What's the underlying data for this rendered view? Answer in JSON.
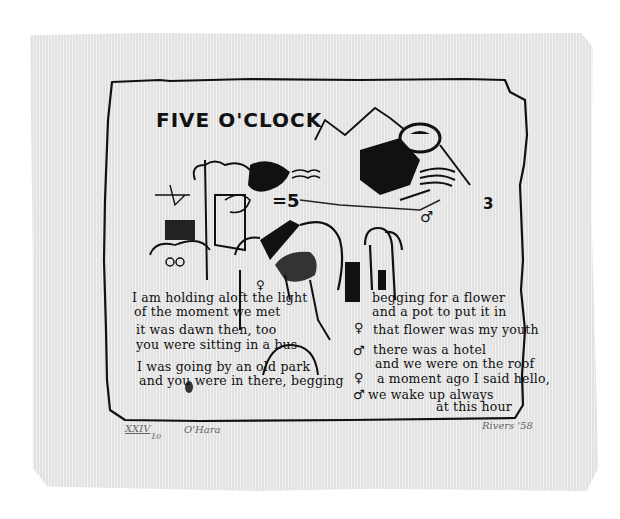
{
  "artwork": {
    "title": "FIVE O'CLOCK",
    "poem": {
      "left_column": [
        "I am holding aloft the light",
        "of the moment we met",
        "it was dawn then, too",
        "you were sitting in a bus",
        "I was going by an old park",
        "and you were in there, begging"
      ],
      "right_column": [
        {
          "symbol": "",
          "text": "begging for a flower"
        },
        {
          "symbol": "",
          "text": "and a pot to put it in"
        },
        {
          "symbol": "♀",
          "text": "that flower was my youth"
        },
        {
          "symbol": "♂",
          "text": "there was a hotel"
        },
        {
          "symbol": "",
          "text": "and we were on the roof"
        },
        {
          "symbol": "♀",
          "text": "a moment ago I said hello,"
        },
        {
          "symbol": "♂",
          "text": "we wake up always"
        },
        {
          "symbol": "",
          "text": "at this hour"
        }
      ]
    },
    "drawing_marks": {
      "number": "=5",
      "male_symbol": "♂",
      "glyph_3": "3",
      "glyph_q": "♀"
    },
    "margin": {
      "edition_number": "XXIV",
      "edition_total": "10",
      "inscription": "O'Hara",
      "signature": "Rivers '58"
    }
  },
  "colors": {
    "paper": "#e9e9e9",
    "ink": "#111111",
    "pencil": "#666666",
    "background": "#ffffff"
  }
}
